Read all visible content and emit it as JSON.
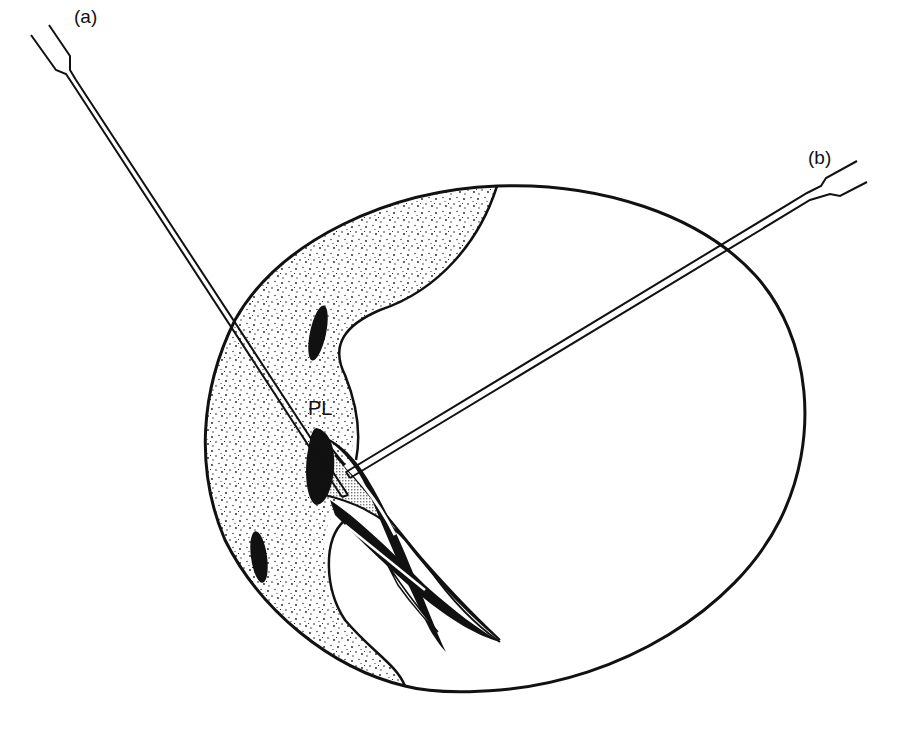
{
  "diagram": {
    "labels": {
      "electrode_a": "(a)",
      "electrode_b": "(b)",
      "region": "PL"
    },
    "colors": {
      "ink": "#111111",
      "background": "#ffffff",
      "stipple": "#1a1a1a",
      "crosshatch": "#9a9a9a"
    },
    "elements": [
      {
        "name": "section-outline",
        "shape": "ellipse"
      },
      {
        "name": "stippled-region",
        "fill": "stipple"
      },
      {
        "name": "dark-nucleus-upper"
      },
      {
        "name": "dark-nucleus-lower"
      },
      {
        "name": "pl-structure",
        "fill": "crosshatch"
      },
      {
        "name": "electrode-a",
        "label": "(a)"
      },
      {
        "name": "electrode-b",
        "label": "(b)"
      }
    ]
  }
}
